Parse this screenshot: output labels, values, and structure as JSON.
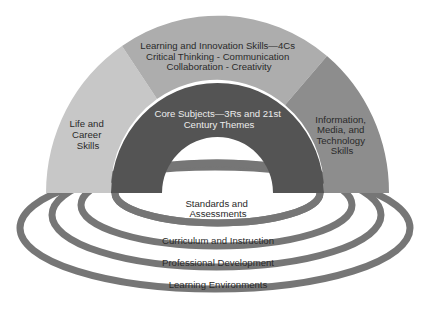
{
  "diagram": {
    "outcomes": {
      "top": {
        "lines": [
          "Learning and Innovation Skills—4Cs",
          "Critical Thinking - Communication",
          "Collaboration - Creativity"
        ],
        "color": "#adadad"
      },
      "left": {
        "lines": [
          "Life and",
          "Career",
          "Skills"
        ],
        "color": "#c7c7c7"
      },
      "right": {
        "lines": [
          "Information,",
          "Media, and",
          "Technology",
          "Skills"
        ],
        "color": "#8d8d8d"
      },
      "core": {
        "lines": [
          "Core Subjects—3Rs and 21st",
          "Century Themes"
        ],
        "color": "#545454"
      }
    },
    "support_systems": {
      "ring_color": "#767676",
      "items": [
        {
          "lines": [
            "Standards and",
            "Assessments"
          ]
        },
        {
          "lines": [
            "Curriculum and Instruction"
          ]
        },
        {
          "lines": [
            "Professional Development"
          ]
        },
        {
          "lines": [
            "Learning Environments"
          ]
        }
      ]
    }
  }
}
